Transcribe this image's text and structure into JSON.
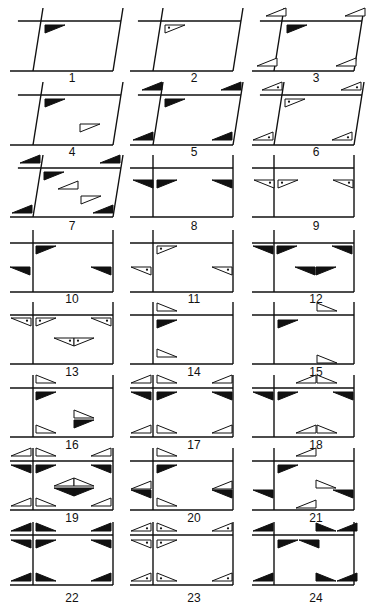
{
  "figure": {
    "colors": {
      "ink": "#111111",
      "paper": "#ffffff"
    },
    "triangle_styles": [
      "filled",
      "outline",
      "dotted"
    ],
    "triangle_orientations": {
      "tl": "right angle at top-left (flat top, vertical left edge)",
      "tr": "right angle at top-right (flat top, vertical right edge)",
      "bl": "right angle at bottom-left (flat bottom, vertical left edge)",
      "br": "right angle at bottom-right (flat bottom, vertical right edge)"
    },
    "panels": [
      {
        "label": "1",
        "shape": "parallelogram",
        "marks": [
          {
            "x": 45,
            "y": 25,
            "o": "tl",
            "s": "filled"
          }
        ]
      },
      {
        "label": "2",
        "shape": "parallelogram",
        "marks": [
          {
            "x": 165,
            "y": 25,
            "o": "tl",
            "s": "dotted"
          }
        ]
      },
      {
        "label": "3",
        "shape": "parallelogram",
        "marks": [
          {
            "x": 266,
            "y": 8,
            "o": "br",
            "s": "outline"
          },
          {
            "x": 345,
            "y": 8,
            "o": "br",
            "s": "outline"
          },
          {
            "x": 287,
            "y": 25,
            "o": "tl",
            "s": "filled"
          },
          {
            "x": 257,
            "y": 58,
            "o": "br",
            "s": "outline"
          },
          {
            "x": 336,
            "y": 58,
            "o": "br",
            "s": "outline"
          }
        ]
      },
      {
        "label": "4",
        "shape": "parallelogram",
        "marks": [
          {
            "x": 45,
            "y": 99,
            "o": "tl",
            "s": "filled"
          },
          {
            "x": 80,
            "y": 124,
            "o": "tl",
            "s": "outline"
          }
        ]
      },
      {
        "label": "5",
        "shape": "parallelogram",
        "marks": [
          {
            "x": 142,
            "y": 82,
            "o": "br",
            "s": "filled"
          },
          {
            "x": 221,
            "y": 82,
            "o": "br",
            "s": "filled"
          },
          {
            "x": 165,
            "y": 99,
            "o": "tl",
            "s": "filled"
          },
          {
            "x": 133,
            "y": 132,
            "o": "br",
            "s": "filled"
          },
          {
            "x": 212,
            "y": 132,
            "o": "br",
            "s": "filled"
          }
        ]
      },
      {
        "label": "6",
        "shape": "parallelogram",
        "marks": [
          {
            "x": 262,
            "y": 82,
            "o": "br",
            "s": "dotted"
          },
          {
            "x": 341,
            "y": 82,
            "o": "br",
            "s": "dotted"
          },
          {
            "x": 285,
            "y": 99,
            "o": "tl",
            "s": "dotted"
          },
          {
            "x": 253,
            "y": 132,
            "o": "br",
            "s": "dotted"
          },
          {
            "x": 332,
            "y": 132,
            "o": "br",
            "s": "dotted"
          }
        ]
      },
      {
        "label": "7",
        "shape": "parallelogram",
        "marks": [
          {
            "x": 20,
            "y": 155,
            "o": "br",
            "s": "filled"
          },
          {
            "x": 100,
            "y": 155,
            "o": "br",
            "s": "filled"
          },
          {
            "x": 44,
            "y": 172,
            "o": "tl",
            "s": "filled"
          },
          {
            "x": 58,
            "y": 181,
            "o": "br",
            "s": "outline"
          },
          {
            "x": 81,
            "y": 196,
            "o": "tl",
            "s": "outline"
          },
          {
            "x": 12,
            "y": 205,
            "o": "br",
            "s": "filled"
          },
          {
            "x": 93,
            "y": 205,
            "o": "br",
            "s": "filled"
          }
        ]
      },
      {
        "label": "8",
        "shape": "rect",
        "marks": [
          {
            "x": 133,
            "y": 180,
            "o": "tr",
            "s": "filled"
          },
          {
            "x": 157,
            "y": 180,
            "o": "tl",
            "s": "filled"
          },
          {
            "x": 212,
            "y": 180,
            "o": "tr",
            "s": "filled"
          }
        ]
      },
      {
        "label": "9",
        "shape": "rect",
        "marks": [
          {
            "x": 254,
            "y": 180,
            "o": "tr",
            "s": "dotted"
          },
          {
            "x": 278,
            "y": 180,
            "o": "tl",
            "s": "dotted"
          },
          {
            "x": 333,
            "y": 180,
            "o": "tr",
            "s": "dotted"
          }
        ]
      },
      {
        "label": "10",
        "shape": "rect",
        "marks": [
          {
            "x": 36,
            "y": 246,
            "o": "tl",
            "s": "filled"
          },
          {
            "x": 10,
            "y": 267,
            "o": "tr",
            "s": "filled"
          },
          {
            "x": 91,
            "y": 267,
            "o": "tr",
            "s": "filled"
          }
        ]
      },
      {
        "label": "11",
        "shape": "rect",
        "marks": [
          {
            "x": 157,
            "y": 246,
            "o": "tl",
            "s": "dotted"
          },
          {
            "x": 131,
            "y": 267,
            "o": "tr",
            "s": "dotted"
          },
          {
            "x": 212,
            "y": 267,
            "o": "tr",
            "s": "dotted"
          }
        ]
      },
      {
        "label": "12",
        "shape": "rect",
        "marks": [
          {
            "x": 253,
            "y": 246,
            "o": "tr",
            "s": "filled"
          },
          {
            "x": 277,
            "y": 246,
            "o": "tl",
            "s": "filled"
          },
          {
            "x": 332,
            "y": 246,
            "o": "tr",
            "s": "filled"
          },
          {
            "x": 295,
            "y": 267,
            "o": "tr",
            "s": "filled"
          },
          {
            "x": 316,
            "y": 267,
            "o": "tl",
            "s": "filled"
          }
        ]
      },
      {
        "label": "13",
        "shape": "rect",
        "marks": [
          {
            "x": 11,
            "y": 318,
            "o": "tr",
            "s": "dotted"
          },
          {
            "x": 36,
            "y": 318,
            "o": "tl",
            "s": "dotted"
          },
          {
            "x": 91,
            "y": 318,
            "o": "tr",
            "s": "dotted"
          },
          {
            "x": 54,
            "y": 338,
            "o": "tr",
            "s": "dotted"
          },
          {
            "x": 74,
            "y": 338,
            "o": "tl",
            "s": "dotted"
          }
        ]
      },
      {
        "label": "14",
        "shape": "rect",
        "marks": [
          {
            "x": 157,
            "y": 303,
            "o": "bl",
            "s": "outline"
          },
          {
            "x": 157,
            "y": 320,
            "o": "tl",
            "s": "filled"
          },
          {
            "x": 157,
            "y": 349,
            "o": "bl",
            "s": "outline"
          }
        ]
      },
      {
        "label": "15",
        "shape": "rect",
        "marks": [
          {
            "x": 317,
            "y": 303,
            "o": "bl",
            "s": "outline"
          },
          {
            "x": 278,
            "y": 320,
            "o": "tl",
            "s": "filled"
          },
          {
            "x": 317,
            "y": 355,
            "o": "bl",
            "s": "outline"
          }
        ]
      },
      {
        "label": "16",
        "shape": "rect",
        "marks": [
          {
            "x": 36,
            "y": 375,
            "o": "bl",
            "s": "outline"
          },
          {
            "x": 36,
            "y": 392,
            "o": "tl",
            "s": "filled"
          },
          {
            "x": 74,
            "y": 410,
            "o": "bl",
            "s": "outline"
          },
          {
            "x": 74,
            "y": 420,
            "o": "tl",
            "s": "filled"
          },
          {
            "x": 36,
            "y": 425,
            "o": "bl",
            "s": "outline"
          }
        ]
      },
      {
        "label": "17",
        "shape": "rect",
        "marks": [
          {
            "x": 131,
            "y": 375,
            "o": "br",
            "s": "outline"
          },
          {
            "x": 157,
            "y": 375,
            "o": "bl",
            "s": "outline"
          },
          {
            "x": 212,
            "y": 375,
            "o": "br",
            "s": "outline"
          },
          {
            "x": 131,
            "y": 392,
            "o": "tr",
            "s": "filled"
          },
          {
            "x": 157,
            "y": 392,
            "o": "tl",
            "s": "filled"
          },
          {
            "x": 212,
            "y": 392,
            "o": "tr",
            "s": "filled"
          },
          {
            "x": 131,
            "y": 425,
            "o": "br",
            "s": "outline"
          },
          {
            "x": 157,
            "y": 425,
            "o": "bl",
            "s": "outline"
          },
          {
            "x": 212,
            "y": 425,
            "o": "br",
            "s": "outline"
          }
        ]
      },
      {
        "label": "18",
        "shape": "rect",
        "marks": [
          {
            "x": 296,
            "y": 375,
            "o": "br",
            "s": "outline"
          },
          {
            "x": 317,
            "y": 375,
            "o": "bl",
            "s": "outline"
          },
          {
            "x": 253,
            "y": 392,
            "o": "tr",
            "s": "filled"
          },
          {
            "x": 278,
            "y": 392,
            "o": "tl",
            "s": "filled"
          },
          {
            "x": 333,
            "y": 392,
            "o": "tr",
            "s": "filled"
          },
          {
            "x": 296,
            "y": 425,
            "o": "br",
            "s": "outline"
          },
          {
            "x": 317,
            "y": 425,
            "o": "bl",
            "s": "outline"
          }
        ]
      },
      {
        "label": "19",
        "shape": "rect",
        "marks": [
          {
            "x": 11,
            "y": 448,
            "o": "br",
            "s": "outline"
          },
          {
            "x": 36,
            "y": 448,
            "o": "bl",
            "s": "outline"
          },
          {
            "x": 91,
            "y": 448,
            "o": "br",
            "s": "outline"
          },
          {
            "x": 11,
            "y": 465,
            "o": "tr",
            "s": "filled"
          },
          {
            "x": 36,
            "y": 465,
            "o": "tl",
            "s": "filled"
          },
          {
            "x": 91,
            "y": 465,
            "o": "tr",
            "s": "filled"
          },
          {
            "x": 54,
            "y": 478,
            "o": "br",
            "s": "outline"
          },
          {
            "x": 74,
            "y": 478,
            "o": "bl",
            "s": "outline"
          },
          {
            "x": 54,
            "y": 488,
            "o": "tr",
            "s": "filled"
          },
          {
            "x": 74,
            "y": 488,
            "o": "tl",
            "s": "filled"
          },
          {
            "x": 11,
            "y": 498,
            "o": "br",
            "s": "outline"
          },
          {
            "x": 36,
            "y": 498,
            "o": "bl",
            "s": "outline"
          },
          {
            "x": 91,
            "y": 498,
            "o": "br",
            "s": "outline"
          }
        ]
      },
      {
        "label": "20",
        "shape": "rect",
        "marks": [
          {
            "x": 157,
            "y": 448,
            "o": "bl",
            "s": "outline"
          },
          {
            "x": 157,
            "y": 465,
            "o": "tl",
            "s": "filled"
          },
          {
            "x": 131,
            "y": 481,
            "o": "br",
            "s": "outline"
          },
          {
            "x": 212,
            "y": 481,
            "o": "br",
            "s": "outline"
          },
          {
            "x": 131,
            "y": 490,
            "o": "tr",
            "s": "filled"
          },
          {
            "x": 212,
            "y": 490,
            "o": "tr",
            "s": "filled"
          },
          {
            "x": 157,
            "y": 498,
            "o": "bl",
            "s": "outline"
          }
        ]
      },
      {
        "label": "21",
        "shape": "rect",
        "marks": [
          {
            "x": 296,
            "y": 448,
            "o": "br",
            "s": "outline"
          },
          {
            "x": 278,
            "y": 465,
            "o": "tl",
            "s": "filled"
          },
          {
            "x": 316,
            "y": 480,
            "o": "bl",
            "s": "outline"
          },
          {
            "x": 253,
            "y": 490,
            "o": "tr",
            "s": "filled"
          },
          {
            "x": 333,
            "y": 490,
            "o": "tr",
            "s": "filled"
          },
          {
            "x": 296,
            "y": 500,
            "o": "br",
            "s": "outline"
          }
        ]
      },
      {
        "label": "22",
        "shape": "rect",
        "marks": [
          {
            "x": 11,
            "y": 523,
            "o": "br",
            "s": "filled"
          },
          {
            "x": 36,
            "y": 523,
            "o": "bl",
            "s": "filled"
          },
          {
            "x": 91,
            "y": 523,
            "o": "br",
            "s": "filled"
          },
          {
            "x": 11,
            "y": 540,
            "o": "tr",
            "s": "filled"
          },
          {
            "x": 36,
            "y": 540,
            "o": "tl",
            "s": "filled"
          },
          {
            "x": 91,
            "y": 540,
            "o": "tr",
            "s": "filled"
          },
          {
            "x": 11,
            "y": 573,
            "o": "br",
            "s": "filled"
          },
          {
            "x": 36,
            "y": 573,
            "o": "bl",
            "s": "filled"
          },
          {
            "x": 91,
            "y": 573,
            "o": "br",
            "s": "filled"
          }
        ]
      },
      {
        "label": "23",
        "shape": "rect",
        "marks": [
          {
            "x": 131,
            "y": 523,
            "o": "br",
            "s": "dotted"
          },
          {
            "x": 157,
            "y": 523,
            "o": "bl",
            "s": "dotted"
          },
          {
            "x": 212,
            "y": 523,
            "o": "br",
            "s": "dotted"
          },
          {
            "x": 131,
            "y": 540,
            "o": "tr",
            "s": "dotted"
          },
          {
            "x": 157,
            "y": 540,
            "o": "tl",
            "s": "dotted"
          },
          {
            "x": 131,
            "y": 573,
            "o": "br",
            "s": "dotted"
          },
          {
            "x": 157,
            "y": 573,
            "o": "bl",
            "s": "dotted"
          },
          {
            "x": 212,
            "y": 573,
            "o": "br",
            "s": "dotted"
          }
        ]
      },
      {
        "label": "24",
        "shape": "rect",
        "marks": [
          {
            "x": 253,
            "y": 523,
            "o": "br",
            "s": "filled"
          },
          {
            "x": 316,
            "y": 523,
            "o": "bl",
            "s": "filled"
          },
          {
            "x": 337,
            "y": 523,
            "o": "br",
            "s": "filled"
          },
          {
            "x": 278,
            "y": 540,
            "o": "tl",
            "s": "filled"
          },
          {
            "x": 299,
            "y": 540,
            "o": "tr",
            "s": "filled"
          },
          {
            "x": 253,
            "y": 573,
            "o": "br",
            "s": "filled"
          },
          {
            "x": 316,
            "y": 573,
            "o": "bl",
            "s": "filled"
          },
          {
            "x": 337,
            "y": 573,
            "o": "br",
            "s": "filled"
          }
        ]
      }
    ]
  },
  "layout": {
    "columns": [
      {
        "outer_left": 10,
        "inner_v": 33,
        "right_v": 113,
        "label_x": 72
      },
      {
        "outer_left": 130,
        "inner_v": 153,
        "right_v": 233,
        "label_x": 194
      },
      {
        "outer_left": 252,
        "inner_v": 274,
        "right_v": 354,
        "label_x": 316
      }
    ],
    "rows": [
      {
        "top": 21,
        "bottom": 71,
        "ext_top": 8,
        "label_y": 82
      },
      {
        "top": 95,
        "bottom": 145,
        "ext_top": 82,
        "label_y": 156
      },
      {
        "top": 168,
        "bottom": 217,
        "ext_top": 155,
        "label_y": 230
      },
      {
        "top": 243,
        "bottom": 292,
        "ext_top": 230,
        "label_y": 303
      },
      {
        "top": 315,
        "bottom": 364,
        "ext_top": 302,
        "label_y": 376
      },
      {
        "top": 388,
        "bottom": 437,
        "ext_top": 375,
        "label_y": 449
      },
      {
        "top": 461,
        "bottom": 510,
        "ext_top": 448,
        "label_y": 522
      },
      {
        "top": 535,
        "bottom": 585,
        "ext_top": 522,
        "label_y": 602
      }
    ]
  }
}
